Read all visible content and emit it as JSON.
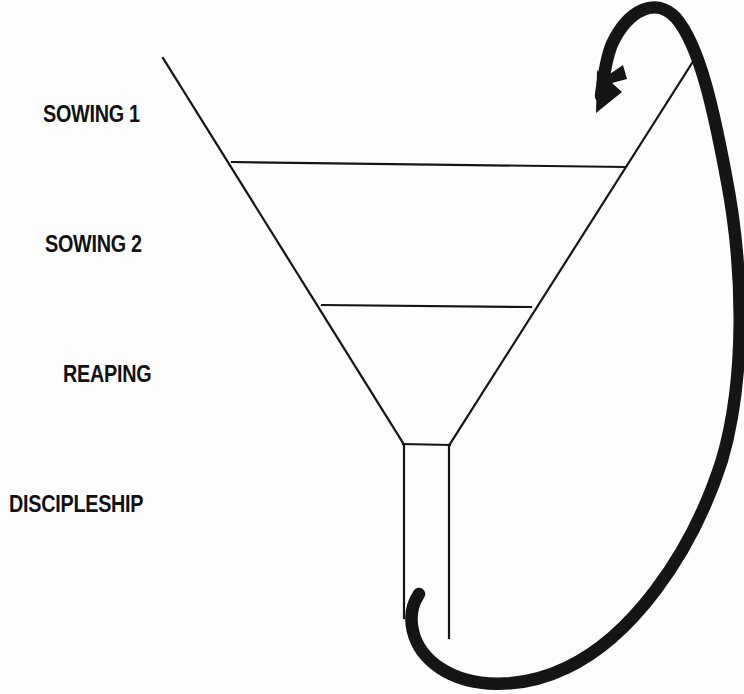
{
  "diagram": {
    "background_color": "#fdfdfd",
    "ink_color": "#111111",
    "stages": [
      {
        "id": "sowing-1",
        "label": "SOWING 1"
      },
      {
        "id": "sowing-2",
        "label": "SOWING 2"
      },
      {
        "id": "reaping",
        "label": "REAPING"
      },
      {
        "id": "discipleship",
        "label": "DISCIPLESHIP"
      }
    ],
    "funnel": {
      "name": "funnel-outline",
      "top_left": [
        163,
        58
      ],
      "top_right": [
        694,
        60
      ],
      "divider_1": {
        "y": 164,
        "x_start": 232,
        "x_end": 625
      },
      "divider_2": {
        "y": 306,
        "x_start": 322,
        "x_end": 531
      },
      "neck": {
        "left_x": 403,
        "right_x": 450,
        "top_y": 443,
        "bottom_left_y": 618,
        "bottom_right_y": 638
      },
      "stroke_width": 2
    },
    "cycle_arrow": {
      "name": "cycle-arrow",
      "description": "thick looping arrow from funnel outlet around the right side back to the funnel mouth",
      "stroke_width": 12,
      "tail": [
        419,
        594
      ],
      "head": [
        596,
        113
      ],
      "color": "#111111"
    }
  }
}
